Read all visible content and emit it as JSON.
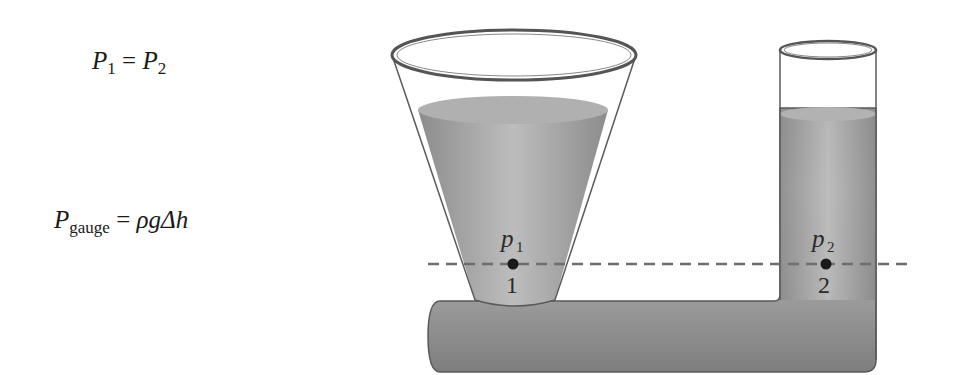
{
  "equations": {
    "eq1": {
      "lhs_var": "P",
      "lhs_sub": "1",
      "op": "=",
      "rhs_var": "P",
      "rhs_sub": "2"
    },
    "eq2": {
      "lhs_var": "P",
      "lhs_sub": "gauge",
      "op": "=",
      "rhs": "ρgΔh"
    }
  },
  "diagram": {
    "point1": {
      "pressure_label": "p",
      "pressure_sub": "1",
      "number": "1"
    },
    "point2": {
      "pressure_label": "p",
      "pressure_sub": "2",
      "number": "2"
    },
    "colors": {
      "fluid": "#a6a6a6",
      "fluid_dark": "#8a8a8a",
      "glass_outline": "#555555",
      "dashed_line": "#6e6e6e",
      "point": "#1a1a1a"
    }
  }
}
